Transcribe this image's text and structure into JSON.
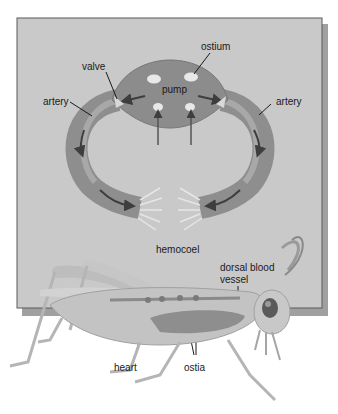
{
  "figure": {
    "type": "open circulatory system diagram"
  },
  "labels": {
    "ostium": "ostium",
    "valve": "valve",
    "pump": "pump",
    "artery_left": "artery",
    "artery_right": "artery",
    "hemocoel": "hemocoel",
    "dorsal_vessel_line1": "dorsal blood",
    "dorsal_vessel_line2": "vessel",
    "heart": "heart",
    "ostia": "ostia"
  },
  "colors": {
    "background": "#ffffff",
    "panel": "#c8c8c8",
    "panel_shadow": "#9a9a9a",
    "vessel": "#8f8f8f",
    "vessel_light": "#b0b0b0",
    "arrow": "#4a4a4a",
    "insect_body": "#c4c4c4",
    "text": "#1a1a1a"
  }
}
